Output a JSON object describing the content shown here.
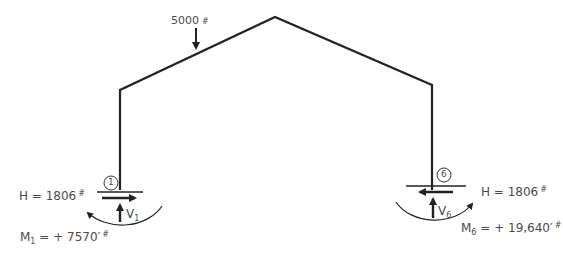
{
  "diagram": {
    "type": "gable frame reactions",
    "load": {
      "value": "5000",
      "unit": "#"
    },
    "joint_left": {
      "number": "1"
    },
    "joint_right": {
      "number": "6"
    },
    "left_reactions": {
      "H_prefix": "H = 1806",
      "H_unit": "#",
      "V_label": "V",
      "V_sub": "1",
      "M_label": "M",
      "M_sub": "1",
      "M_value": " = + 7570′",
      "M_unit": "#"
    },
    "right_reactions": {
      "H_prefix": "H = 1806",
      "H_unit": "#",
      "V_label": "V",
      "V_sub": "6",
      "M_label": "M",
      "M_sub": "6",
      "M_value": " = + 19,640′",
      "M_unit": "#"
    },
    "colors": {
      "line": "#222222",
      "text": "#4a4a4a"
    }
  }
}
